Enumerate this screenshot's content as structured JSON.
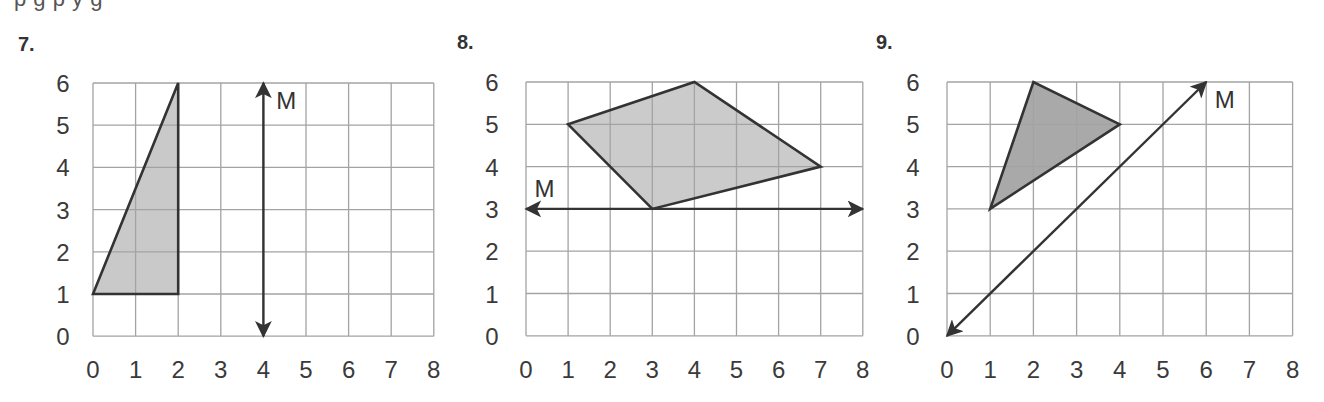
{
  "header": {
    "clipped_instruction_text": "p                                          g p y g"
  },
  "problems": [
    {
      "number_label": "7.",
      "line_label": "M",
      "x_ticks": [
        "0",
        "1",
        "2",
        "3",
        "4",
        "5",
        "6",
        "7",
        "8"
      ],
      "y_ticks": [
        "0",
        "1",
        "2",
        "3",
        "4",
        "5",
        "6"
      ],
      "polygon": [
        [
          0,
          1
        ],
        [
          2,
          6
        ],
        [
          2,
          1
        ]
      ],
      "fill": "#c9c9c9",
      "line_M": {
        "from": [
          4,
          0
        ],
        "to": [
          4,
          6
        ],
        "arrows": "both"
      },
      "m_label_pos": [
        4.3,
        5.6
      ]
    },
    {
      "number_label": "8.",
      "line_label": "M",
      "x_ticks": [
        "0",
        "1",
        "2",
        "3",
        "4",
        "5",
        "6",
        "7",
        "8"
      ],
      "y_ticks": [
        "0",
        "1",
        "2",
        "3",
        "4",
        "5",
        "6"
      ],
      "polygon": [
        [
          1,
          5
        ],
        [
          4,
          6
        ],
        [
          7,
          4
        ],
        [
          3,
          3
        ]
      ],
      "fill": "#cbcbcb",
      "line_M": {
        "from": [
          0,
          3
        ],
        "to": [
          8,
          3
        ],
        "arrows": "both"
      },
      "m_label_pos": [
        0.2,
        3.5
      ]
    },
    {
      "number_label": "9.",
      "line_label": "M",
      "x_ticks": [
        "0",
        "1",
        "2",
        "3",
        "4",
        "5",
        "6",
        "7",
        "8"
      ],
      "y_ticks": [
        "0",
        "1",
        "2",
        "3",
        "4",
        "5",
        "6"
      ],
      "polygon": [
        [
          1,
          3
        ],
        [
          2,
          6
        ],
        [
          4,
          5
        ]
      ],
      "fill": "#a9a9a9",
      "line_M": {
        "from": [
          0,
          0
        ],
        "to": [
          6,
          6
        ],
        "arrows": "both"
      },
      "m_label_pos": [
        6.2,
        5.6
      ]
    }
  ],
  "colors": {
    "grid": "#a3a3a3",
    "outline": "#333333",
    "text": "#3a3a3a"
  }
}
